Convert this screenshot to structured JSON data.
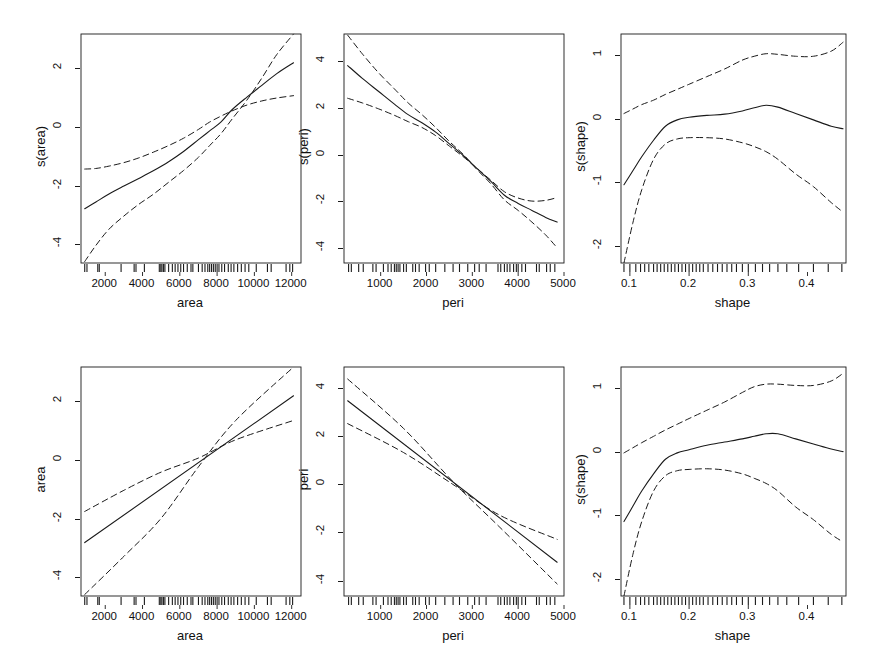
{
  "figure": {
    "title": "",
    "background": "#ffffff",
    "line_color": "#1a1a1a",
    "rug_color": "#1a1a1a",
    "rows": 2,
    "cols": 3
  },
  "chart_data": [
    {
      "id": "panel-s-area-smooth",
      "type": "line",
      "title": "",
      "xlabel": "area",
      "ylabel": "s(area)",
      "xlim": [
        700,
        12500
      ],
      "ylim": [
        -4.6,
        3.2
      ],
      "xticks": [
        2000,
        4000,
        6000,
        8000,
        10000,
        12000
      ],
      "xticklabels": [
        "2000",
        "4000",
        "6000",
        "8000",
        "10000",
        "12000"
      ],
      "yticks": [
        -4,
        -2,
        0,
        2
      ],
      "yticklabels": [
        "-4",
        "-2",
        "0",
        "2"
      ],
      "grid": false,
      "legend": "none",
      "series": [
        {
          "name": "fit",
          "style": "solid",
          "x": [
            900,
            1500,
            2200,
            3000,
            3800,
            4600,
            5400,
            6200,
            7000,
            7600,
            8200,
            8800,
            9600,
            10400,
            11200,
            12100
          ],
          "values": [
            -2.75,
            -2.52,
            -2.25,
            -1.98,
            -1.72,
            -1.45,
            -1.15,
            -0.8,
            -0.4,
            -0.1,
            0.2,
            0.62,
            1.05,
            1.45,
            1.85,
            2.22
          ]
        },
        {
          "name": "upper_ci",
          "style": "dashed",
          "x": [
            900,
            1500,
            2200,
            3000,
            3800,
            4600,
            5400,
            6200,
            7000,
            7600,
            8200,
            8800,
            9600,
            10400,
            11200,
            12100
          ],
          "values": [
            -1.4,
            -1.38,
            -1.3,
            -1.18,
            -1.02,
            -0.82,
            -0.6,
            -0.35,
            -0.05,
            0.2,
            0.4,
            0.58,
            0.78,
            0.92,
            1.02,
            1.1
          ]
        },
        {
          "name": "lower_ci",
          "style": "dashed",
          "x": [
            900,
            1500,
            2200,
            3000,
            3800,
            4600,
            5400,
            6200,
            7000,
            7600,
            8200,
            8800,
            9600,
            10400,
            11200,
            12100
          ],
          "values": [
            -4.55,
            -4.0,
            -3.45,
            -3.0,
            -2.6,
            -2.25,
            -1.85,
            -1.45,
            -1.0,
            -0.6,
            -0.2,
            0.3,
            0.95,
            1.7,
            2.5,
            3.2
          ]
        }
      ],
      "rug": [
        900,
        1020,
        1600,
        1680,
        2850,
        3550,
        3650,
        4100,
        4900,
        4980,
        5040,
        5120,
        5200,
        5400,
        5600,
        5750,
        5900,
        6050,
        6200,
        6400,
        6600,
        6700,
        7000,
        7200,
        7350,
        7500,
        7600,
        7700,
        7800,
        7900,
        8000,
        8100,
        8250,
        8400,
        8600,
        8750,
        8900,
        9100,
        9300,
        9500,
        9700,
        10100,
        10700,
        10900,
        11700,
        11900,
        12050
      ]
    },
    {
      "id": "panel-s-peri-smooth",
      "type": "line",
      "title": "",
      "xlabel": "peri",
      "ylabel": "s(peri)",
      "xlim": [
        200,
        5000
      ],
      "ylim": [
        -4.6,
        5.2
      ],
      "xticks": [
        1000,
        2000,
        3000,
        4000,
        5000
      ],
      "xticklabels": [
        "1000",
        "2000",
        "3000",
        "4000",
        "5000"
      ],
      "yticks": [
        -4,
        -2,
        0,
        2,
        4
      ],
      "yticklabels": [
        "-4",
        "-2",
        "0",
        "2",
        "4"
      ],
      "grid": false,
      "legend": "none",
      "series": [
        {
          "name": "fit",
          "style": "solid",
          "x": [
            280,
            600,
            950,
            1300,
            1600,
            1900,
            2200,
            2500,
            2800,
            3100,
            3400,
            3700,
            4000,
            4300,
            4600,
            4850
          ],
          "values": [
            3.85,
            3.3,
            2.75,
            2.2,
            1.75,
            1.4,
            1.0,
            0.5,
            0.0,
            -0.55,
            -1.1,
            -1.7,
            -2.05,
            -2.35,
            -2.65,
            -2.85
          ]
        },
        {
          "name": "upper_ci",
          "style": "dashed",
          "x": [
            280,
            600,
            950,
            1300,
            1600,
            1900,
            2200,
            2500,
            2800,
            3100,
            3400,
            3700,
            4000,
            4300,
            4600,
            4850
          ],
          "values": [
            2.45,
            2.25,
            2.0,
            1.72,
            1.45,
            1.2,
            0.85,
            0.4,
            -0.05,
            -0.55,
            -1.05,
            -1.55,
            -1.82,
            -1.95,
            -1.92,
            -1.8
          ]
        },
        {
          "name": "lower_ci",
          "style": "dashed",
          "x": [
            280,
            600,
            950,
            1300,
            1600,
            1900,
            2200,
            2500,
            2800,
            3100,
            3400,
            3700,
            4000,
            4300,
            4600,
            4850
          ],
          "values": [
            5.15,
            4.35,
            3.55,
            2.85,
            2.25,
            1.75,
            1.2,
            0.6,
            0.05,
            -0.6,
            -1.2,
            -1.9,
            -2.35,
            -2.85,
            -3.4,
            -3.95
          ]
        }
      ],
      "rug": [
        300,
        360,
        520,
        620,
        830,
        900,
        1060,
        1160,
        1230,
        1300,
        1340,
        1380,
        1420,
        1500,
        1560,
        1700,
        1760,
        1840,
        1980,
        2060,
        2200,
        2400,
        2580,
        2720,
        2900,
        3050,
        3150,
        3300,
        3560,
        3620,
        3700,
        3760,
        3820,
        3900,
        3960,
        4000,
        4080,
        4160,
        4400,
        4460,
        4620,
        4700,
        4800
      ]
    },
    {
      "id": "panel-s-shape-smooth",
      "type": "line",
      "title": "",
      "xlabel": "shape",
      "ylabel": "s(shape)",
      "xlim": [
        0.085,
        0.465
      ],
      "ylim": [
        -2.25,
        1.35
      ],
      "xticks": [
        0.1,
        0.2,
        0.3,
        0.4
      ],
      "xticklabels": [
        "0.1",
        "0.2",
        "0.3",
        "0.4"
      ],
      "yticks": [
        -2,
        -1,
        0,
        1
      ],
      "yticklabels": [
        "-2",
        "-1",
        "0",
        "1"
      ],
      "grid": false,
      "legend": "none",
      "series": [
        {
          "name": "fit",
          "style": "solid",
          "x": [
            0.09,
            0.105,
            0.12,
            0.14,
            0.16,
            0.18,
            0.2,
            0.23,
            0.26,
            0.29,
            0.31,
            0.33,
            0.35,
            0.38,
            0.41,
            0.44,
            0.46
          ],
          "values": [
            -1.02,
            -0.8,
            -0.58,
            -0.32,
            -0.1,
            0.0,
            0.04,
            0.07,
            0.09,
            0.14,
            0.19,
            0.23,
            0.2,
            0.1,
            0.0,
            -0.1,
            -0.14
          ]
        },
        {
          "name": "upper_ci",
          "style": "dashed",
          "x": [
            0.09,
            0.105,
            0.12,
            0.14,
            0.16,
            0.18,
            0.2,
            0.23,
            0.26,
            0.29,
            0.31,
            0.33,
            0.35,
            0.38,
            0.41,
            0.44,
            0.46
          ],
          "values": [
            0.1,
            0.17,
            0.24,
            0.31,
            0.4,
            0.48,
            0.56,
            0.68,
            0.8,
            0.94,
            1.0,
            1.04,
            1.03,
            1.0,
            1.0,
            1.08,
            1.22
          ]
        },
        {
          "name": "lower_ci",
          "style": "dashed",
          "x": [
            0.09,
            0.105,
            0.12,
            0.14,
            0.16,
            0.18,
            0.2,
            0.23,
            0.26,
            0.29,
            0.31,
            0.33,
            0.35,
            0.38,
            0.41,
            0.44,
            0.46
          ],
          "values": [
            -2.25,
            -1.62,
            -1.1,
            -0.62,
            -0.38,
            -0.3,
            -0.28,
            -0.28,
            -0.3,
            -0.36,
            -0.42,
            -0.5,
            -0.62,
            -0.85,
            -1.05,
            -1.3,
            -1.45
          ]
        }
      ],
      "rug": [
        0.09,
        0.1,
        0.11,
        0.118,
        0.125,
        0.132,
        0.14,
        0.146,
        0.152,
        0.158,
        0.164,
        0.17,
        0.176,
        0.182,
        0.188,
        0.194,
        0.2,
        0.206,
        0.212,
        0.218,
        0.224,
        0.232,
        0.24,
        0.248,
        0.256,
        0.264,
        0.272,
        0.28,
        0.29,
        0.3,
        0.312,
        0.324,
        0.336,
        0.35,
        0.365,
        0.385,
        0.41,
        0.435,
        0.458
      ]
    },
    {
      "id": "panel-area-linear",
      "type": "line",
      "title": "",
      "xlabel": "area",
      "ylabel": "area",
      "xlim": [
        700,
        12500
      ],
      "ylim": [
        -4.6,
        3.2
      ],
      "xticks": [
        2000,
        4000,
        6000,
        8000,
        10000,
        12000
      ],
      "xticklabels": [
        "2000",
        "4000",
        "6000",
        "8000",
        "10000",
        "12000"
      ],
      "yticks": [
        -4,
        -2,
        0,
        2
      ],
      "yticklabels": [
        "-4",
        "-2",
        "0",
        "2"
      ],
      "grid": false,
      "legend": "none",
      "series": [
        {
          "name": "fit",
          "style": "solid",
          "x": [
            900,
            12100
          ],
          "values": [
            -2.78,
            2.22
          ]
        },
        {
          "name": "upper_ci",
          "style": "dashed",
          "x": [
            900,
            3000,
            5000,
            7000,
            9000,
            12100
          ],
          "values": [
            -1.72,
            -1.0,
            -0.38,
            0.1,
            0.72,
            1.38
          ]
        },
        {
          "name": "lower_ci",
          "style": "dashed",
          "x": [
            900,
            3000,
            5000,
            7000,
            9000,
            12100
          ],
          "values": [
            -4.55,
            -3.25,
            -1.95,
            -0.2,
            1.38,
            3.2
          ]
        }
      ],
      "rug": [
        900,
        1020,
        1600,
        1680,
        2850,
        3550,
        3650,
        4100,
        4900,
        4980,
        5040,
        5120,
        5200,
        5400,
        5600,
        5750,
        5900,
        6050,
        6200,
        6400,
        6600,
        6700,
        7000,
        7200,
        7350,
        7500,
        7600,
        7700,
        7800,
        7900,
        8000,
        8100,
        8250,
        8400,
        8600,
        8750,
        8900,
        9100,
        9300,
        9500,
        9700,
        10100,
        10700,
        10900,
        11700,
        11900,
        12050
      ]
    },
    {
      "id": "panel-peri-linear",
      "type": "line",
      "title": "",
      "xlabel": "peri",
      "ylabel": "peri",
      "xlim": [
        200,
        5000
      ],
      "ylim": [
        -4.6,
        4.9
      ],
      "xticks": [
        1000,
        2000,
        3000,
        4000,
        5000
      ],
      "xticklabels": [
        "1000",
        "2000",
        "3000",
        "4000",
        "5000"
      ],
      "yticks": [
        -4,
        -2,
        0,
        2,
        4
      ],
      "yticklabels": [
        "-4",
        "-2",
        "0",
        "2",
        "4"
      ],
      "grid": false,
      "legend": "none",
      "series": [
        {
          "name": "fit",
          "style": "solid",
          "x": [
            280,
            4850
          ],
          "values": [
            3.5,
            -3.2
          ]
        },
        {
          "name": "upper_ci",
          "style": "dashed",
          "x": [
            280,
            1500,
            2600,
            3600,
            4850
          ],
          "values": [
            2.55,
            1.35,
            0.0,
            -1.25,
            -2.25
          ]
        },
        {
          "name": "lower_ci",
          "style": "dashed",
          "x": [
            280,
            1500,
            2600,
            3600,
            4850
          ],
          "values": [
            4.4,
            2.35,
            0.1,
            -1.75,
            -4.1
          ]
        }
      ],
      "rug": [
        300,
        360,
        520,
        620,
        830,
        900,
        1060,
        1160,
        1230,
        1300,
        1340,
        1380,
        1420,
        1500,
        1560,
        1700,
        1760,
        1840,
        1980,
        2060,
        2200,
        2400,
        2580,
        2720,
        2900,
        3050,
        3150,
        3300,
        3560,
        3620,
        3700,
        3760,
        3820,
        3900,
        3960,
        4000,
        4080,
        4160,
        4400,
        4460,
        4620,
        4700,
        4800
      ]
    },
    {
      "id": "panel-s-shape-smooth-2",
      "type": "line",
      "title": "",
      "xlabel": "shape",
      "ylabel": "s(shape)",
      "xlim": [
        0.085,
        0.465
      ],
      "ylim": [
        -2.25,
        1.35
      ],
      "xticks": [
        0.1,
        0.2,
        0.3,
        0.4
      ],
      "xticklabels": [
        "0.1",
        "0.2",
        "0.3",
        "0.4"
      ],
      "yticks": [
        -2,
        -1,
        0,
        1
      ],
      "yticklabels": [
        "-2",
        "-1",
        "0",
        "1"
      ],
      "grid": false,
      "legend": "none",
      "series": [
        {
          "name": "fit",
          "style": "solid",
          "x": [
            0.09,
            0.105,
            0.12,
            0.14,
            0.16,
            0.18,
            0.2,
            0.23,
            0.26,
            0.29,
            0.31,
            0.33,
            0.35,
            0.38,
            0.41,
            0.44,
            0.46
          ],
          "values": [
            -1.08,
            -0.84,
            -0.6,
            -0.33,
            -0.1,
            0.0,
            0.05,
            0.12,
            0.17,
            0.22,
            0.26,
            0.3,
            0.3,
            0.22,
            0.14,
            0.06,
            0.02
          ]
        },
        {
          "name": "upper_ci",
          "style": "dashed",
          "x": [
            0.09,
            0.105,
            0.12,
            0.14,
            0.16,
            0.18,
            0.2,
            0.23,
            0.26,
            0.29,
            0.31,
            0.33,
            0.35,
            0.38,
            0.41,
            0.44,
            0.46
          ],
          "values": [
            0.0,
            0.08,
            0.16,
            0.26,
            0.36,
            0.45,
            0.54,
            0.67,
            0.8,
            0.95,
            1.04,
            1.08,
            1.08,
            1.06,
            1.06,
            1.13,
            1.25
          ]
        },
        {
          "name": "lower_ci",
          "style": "dashed",
          "x": [
            0.09,
            0.105,
            0.12,
            0.14,
            0.16,
            0.18,
            0.2,
            0.23,
            0.26,
            0.29,
            0.31,
            0.33,
            0.35,
            0.38,
            0.41,
            0.44,
            0.46
          ],
          "values": [
            -2.25,
            -1.6,
            -1.08,
            -0.6,
            -0.36,
            -0.28,
            -0.26,
            -0.25,
            -0.27,
            -0.33,
            -0.4,
            -0.48,
            -0.6,
            -0.85,
            -1.05,
            -1.28,
            -1.4
          ]
        }
      ],
      "rug": [
        0.09,
        0.1,
        0.11,
        0.118,
        0.125,
        0.132,
        0.14,
        0.146,
        0.152,
        0.158,
        0.164,
        0.17,
        0.176,
        0.182,
        0.188,
        0.194,
        0.2,
        0.206,
        0.212,
        0.218,
        0.224,
        0.232,
        0.24,
        0.248,
        0.256,
        0.264,
        0.272,
        0.28,
        0.29,
        0.3,
        0.312,
        0.324,
        0.336,
        0.35,
        0.365,
        0.385,
        0.41,
        0.435,
        0.458
      ]
    }
  ],
  "layout": {
    "panel_boxes": [
      {
        "id": "panel-s-area-smooth",
        "left": 80,
        "top": 33,
        "width": 220,
        "height": 229
      },
      {
        "id": "panel-s-peri-smooth",
        "left": 343,
        "top": 33,
        "width": 220,
        "height": 229
      },
      {
        "id": "panel-s-shape-smooth",
        "left": 620,
        "top": 33,
        "width": 225,
        "height": 229
      },
      {
        "id": "panel-area-linear",
        "left": 80,
        "top": 366,
        "width": 220,
        "height": 229
      },
      {
        "id": "panel-peri-linear",
        "left": 343,
        "top": 366,
        "width": 220,
        "height": 229
      },
      {
        "id": "panel-s-shape-smooth-2",
        "left": 620,
        "top": 366,
        "width": 225,
        "height": 229
      }
    ]
  }
}
